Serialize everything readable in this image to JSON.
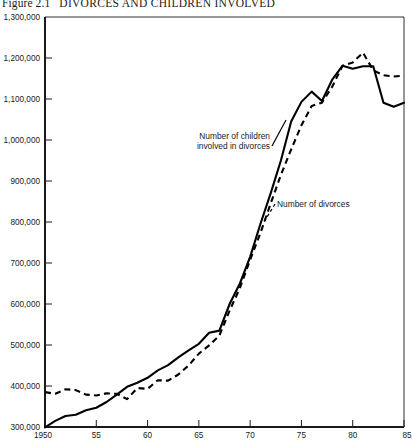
{
  "figure": {
    "number": "Figure 2.1",
    "caption": "DIVORCES AND CHILDREN INVOLVED",
    "full_title": "Figure 2.1   DIVORCES AND CHILDREN INVOLVED"
  },
  "annotations": {
    "children_label_line1": "Number of children",
    "children_label_line2": "involved in divorces",
    "divorces_label": "Number of divorces"
  },
  "axis": {
    "y_tick_labels": [
      "1,300,000",
      "1,200,000",
      "1,100,000",
      "1,000,000",
      "900,000",
      "800,000",
      "700,000",
      "600,000",
      "500,000",
      "400,000",
      "300,000"
    ],
    "x_tick_labels": [
      "1950",
      "55",
      "60",
      "65",
      "70",
      "75",
      "80",
      "85"
    ]
  },
  "chart_data": {
    "type": "line",
    "xlabel": "",
    "ylabel": "",
    "xlim": [
      1950,
      1985
    ],
    "ylim": [
      300000,
      1300000
    ],
    "grid": false,
    "legend_position": "inline-annotations",
    "x_ticks": [
      1950,
      1955,
      1960,
      1965,
      1970,
      1975,
      1980,
      1985
    ],
    "x_tick_labels": [
      "1950",
      "55",
      "60",
      "65",
      "70",
      "75",
      "80",
      "85"
    ],
    "y_ticks": [
      300000,
      400000,
      500000,
      600000,
      700000,
      800000,
      900000,
      1000000,
      1100000,
      1200000,
      1300000
    ],
    "y_tick_labels": [
      "300,000",
      "400,000",
      "500,000",
      "600,000",
      "700,000",
      "800,000",
      "900,000",
      "1,000,000",
      "1,100,000",
      "1,200,000",
      "1,300,000"
    ],
    "x": [
      1950,
      1951,
      1952,
      1953,
      1954,
      1955,
      1956,
      1957,
      1958,
      1959,
      1960,
      1961,
      1962,
      1963,
      1964,
      1965,
      1966,
      1967,
      1968,
      1969,
      1970,
      1971,
      1972,
      1973,
      1974,
      1975,
      1976,
      1977,
      1978,
      1979,
      1980,
      1981,
      1982,
      1983,
      1984,
      1985
    ],
    "series": [
      {
        "name": "Number of children involved in divorces",
        "style": "solid",
        "annotation": "Number of children involved in divorces",
        "values": [
          299000,
          315000,
          327000,
          330000,
          341000,
          347000,
          361000,
          379000,
          398000,
          408000,
          420000,
          438000,
          451000,
          470000,
          487000,
          503000,
          530000,
          535000,
          600000,
          650000,
          715000,
          795000,
          870000,
          950000,
          1045000,
          1093000,
          1118000,
          1095000,
          1147000,
          1181000,
          1174000,
          1180000,
          1180000,
          1091000,
          1081000,
          1091000
        ]
      },
      {
        "name": "Number of divorces",
        "style": "dashed",
        "annotation": "Number of divorces",
        "values": [
          385000,
          381000,
          392000,
          390000,
          379000,
          377000,
          382000,
          381000,
          368000,
          395000,
          393000,
          414000,
          413000,
          428000,
          450000,
          479000,
          499000,
          523000,
          584000,
          639000,
          708000,
          773000,
          845000,
          915000,
          977000,
          1036000,
          1083000,
          1091000,
          1130000,
          1181000,
          1189000,
          1213000,
          1170000,
          1158000,
          1155000,
          1157000
        ]
      }
    ]
  },
  "geometry": {
    "plot_left": 45,
    "plot_right": 404,
    "plot_top": 17,
    "plot_bottom": 427
  }
}
